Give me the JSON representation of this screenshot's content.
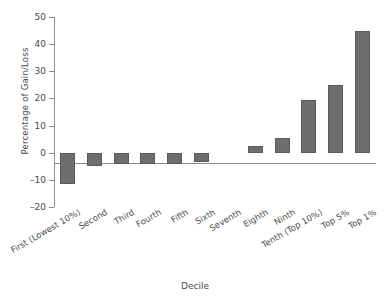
{
  "chart_data": {
    "type": "bar",
    "title": "",
    "xlabel": "Decile",
    "ylabel": "Percentage of Gain/Loss",
    "categories": [
      "First (Lowest 10%)",
      "Second",
      "Third",
      "Fourth",
      "Fifth",
      "Sixth",
      "Seventh",
      "Eighth",
      "Ninth",
      "Tenth (Top 10%)",
      "Top 5%",
      "Top 1%"
    ],
    "values": [
      -11.5,
      -5,
      -4,
      -4,
      -4,
      -3.5,
      0,
      2.5,
      5.5,
      19.5,
      25,
      45
    ],
    "ylim": [
      -20,
      50
    ],
    "yticks": [
      -20,
      -10,
      0,
      10,
      20,
      30,
      40,
      50
    ],
    "ytick_labels": [
      "–20",
      "–10",
      "0",
      "10",
      "20",
      "30",
      "40",
      "50"
    ],
    "grid": false,
    "legend": false,
    "bar_color": "#6e6e6e",
    "axis_color": "#8c8c8c"
  }
}
